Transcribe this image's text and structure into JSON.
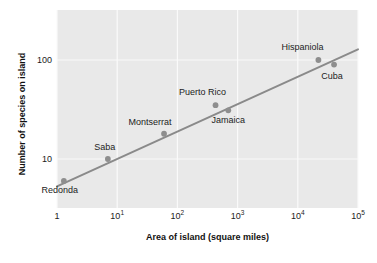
{
  "chart_data": {
    "type": "scatter",
    "title": "",
    "xlabel": "Area of island (square miles)",
    "ylabel": "Number of species on island",
    "xscale": "log",
    "yscale": "log",
    "xlim": [
      1,
      100000
    ],
    "ylim": [
      3.2,
      320
    ],
    "grid": true,
    "legend": false,
    "xtick_labels": [
      "1",
      "10",
      "10",
      "10",
      "10",
      "10"
    ],
    "xtick_exponents": [
      "",
      "1",
      "2",
      "3",
      "4",
      "5"
    ],
    "xtick_values": [
      1,
      10,
      100,
      1000,
      10000,
      100000
    ],
    "ytick_labels": [
      "100",
      "10"
    ],
    "ytick_values": [
      100,
      10
    ],
    "point_color": "#8e8e8e",
    "line_color": "#8a8a8a",
    "panel_color": "#e9e9e9",
    "grid_color": "#fafafa",
    "points": [
      {
        "name": "Redonda",
        "area": 1.3,
        "species": 6,
        "label_dx": -4,
        "label_dy": 13
      },
      {
        "name": "Saba",
        "area": 7,
        "species": 10,
        "label_dx": -3,
        "label_dy": -8
      },
      {
        "name": "Montserrat",
        "area": 60,
        "species": 18,
        "label_dx": -14,
        "label_dy": -8
      },
      {
        "name": "Puerto Rico",
        "area": 430,
        "species": 35,
        "label_dx": -13,
        "label_dy": -9
      },
      {
        "name": "Jamaica",
        "area": 700,
        "species": 31,
        "label_dx": 0,
        "label_dy": 14
      },
      {
        "name": "Hispaniola",
        "area": 22000,
        "species": 100,
        "label_dx": -16,
        "label_dy": -9
      },
      {
        "name": "Cuba",
        "area": 40000,
        "species": 90,
        "label_dx": -2,
        "label_dy": 15
      }
    ],
    "trendline": {
      "description": "species-area power law fit",
      "x1": 1.0,
      "y1": 5.3,
      "x2": 100000,
      "y2": 128
    }
  }
}
